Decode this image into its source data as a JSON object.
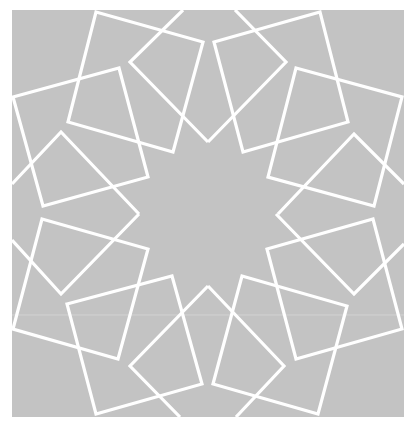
{
  "image": {
    "description": "Islamic geometric pattern: central 12-point star formed by eight overlapping rotated squares and star point lines, white strokes on gray",
    "background_color": "#ffffff",
    "panel_color": "#c3c3c3",
    "stroke_color": "#ffffff",
    "panel": {
      "x": 12,
      "y": 10,
      "width": 392,
      "height": 407
    },
    "seam_line_y": 315
  },
  "squares": [
    {
      "name": "square-top-left-upper",
      "points": "96,12 203,42 173,152 68,122"
    },
    {
      "name": "square-top-left-lower",
      "points": "13,97 119,68 148,177 43,206"
    },
    {
      "name": "square-top-right-upper",
      "points": "214,42 320,12 348,122 243,152"
    },
    {
      "name": "square-top-right-lower",
      "points": "296,68 402,97 374,206 268,177"
    },
    {
      "name": "square-bottom-left-upper",
      "points": "42,219 148,249 118,359 13,329"
    },
    {
      "name": "square-bottom-left-lower",
      "points": "67,304 172,276 202,384 96,414"
    },
    {
      "name": "square-bottom-right-upper",
      "points": "267,249 373,219 402,329 296,359"
    },
    {
      "name": "square-bottom-right-lower",
      "points": "242,276 347,306 318,414 213,384"
    }
  ],
  "star_lines": [
    {
      "name": "star-point-top-left",
      "points": "183,10 130,62 208,142"
    },
    {
      "name": "star-point-top-right",
      "points": "235,10 286,62 208,142"
    },
    {
      "name": "star-point-left-upper",
      "points": "12,184 61,132 139,214"
    },
    {
      "name": "star-point-right-upper",
      "points": "404,184 354,134 278,214"
    },
    {
      "name": "star-point-left-lower",
      "points": "12,240 61,294 139,214"
    },
    {
      "name": "star-point-right-lower",
      "points": "404,244 354,294 276,214"
    },
    {
      "name": "star-point-bottom-left",
      "points": "180,417 130,366 208,286"
    },
    {
      "name": "star-point-bottom-right",
      "points": "236,417 284,366 208,286"
    }
  ]
}
